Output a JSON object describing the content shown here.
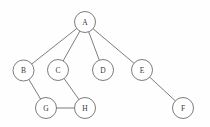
{
  "figure": {
    "background_color": "#fefefe",
    "stroke_color": "#6e6e6e",
    "node_fill_color": "#ffffff",
    "label_color": "#3a3a3a",
    "node_radius": 10.5,
    "width": 210,
    "height": 127
  },
  "graph": {
    "type": "node-link-diagram",
    "directed": false,
    "nodes": [
      {
        "id": "A",
        "label": "A",
        "cx": 85,
        "cy": 22,
        "r": 10.5
      },
      {
        "id": "B",
        "label": "B",
        "cx": 23.5,
        "cy": 70.5,
        "r": 10.5
      },
      {
        "id": "C",
        "label": "C",
        "cx": 58,
        "cy": 70,
        "r": 10.5
      },
      {
        "id": "D",
        "label": "D",
        "cx": 103,
        "cy": 70,
        "r": 10.5
      },
      {
        "id": "E",
        "label": "E",
        "cx": 142,
        "cy": 70,
        "r": 10.5
      },
      {
        "id": "G",
        "label": "G",
        "cx": 46,
        "cy": 108,
        "r": 10.5
      },
      {
        "id": "H",
        "label": "H",
        "cx": 85,
        "cy": 108,
        "r": 10.5
      },
      {
        "id": "F",
        "label": "F",
        "cx": 183,
        "cy": 108,
        "r": 10.5
      }
    ],
    "edges": [
      {
        "source": "A",
        "target": "B"
      },
      {
        "source": "A",
        "target": "C"
      },
      {
        "source": "A",
        "target": "D"
      },
      {
        "source": "A",
        "target": "E"
      },
      {
        "source": "B",
        "target": "G"
      },
      {
        "source": "C",
        "target": "H"
      },
      {
        "source": "G",
        "target": "H"
      },
      {
        "source": "E",
        "target": "F"
      }
    ]
  }
}
